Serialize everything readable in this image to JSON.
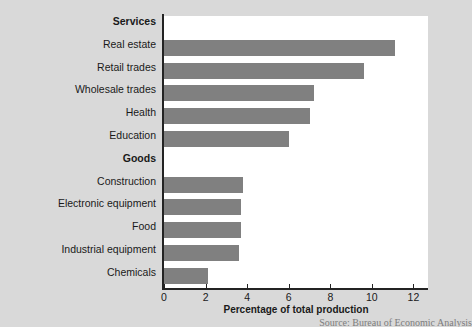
{
  "chart_data": {
    "type": "bar",
    "orientation": "horizontal",
    "title": "",
    "xlabel": "Percentage of total production",
    "ylabel": "",
    "xlim": [
      0,
      12.7
    ],
    "grid": false,
    "legend": null,
    "xticks": [
      0,
      2,
      4,
      6,
      8,
      10,
      12
    ],
    "xticklabels": [
      "0",
      "2",
      "4",
      "6",
      "8",
      "10",
      "12"
    ],
    "bar_color": "#808080",
    "background_color": "#d9d9d9",
    "plot_background_color": "#ffffff",
    "axis_color": "#232323",
    "groups": [
      {
        "name": "Services",
        "categories": [
          "Real estate",
          "Retail trades",
          "Wholesale trades",
          "Health",
          "Education"
        ],
        "values": [
          11.1,
          9.6,
          7.2,
          7.0,
          6.0
        ]
      },
      {
        "name": "Goods",
        "categories": [
          "Construction",
          "Electronic equipment",
          "Food",
          "Industrial equipment",
          "Chemicals"
        ],
        "values": [
          3.8,
          3.7,
          3.7,
          3.6,
          2.1
        ]
      }
    ],
    "categories": [
      "Real estate",
      "Retail trades",
      "Wholesale trades",
      "Health",
      "Education",
      "Construction",
      "Electronic equipment",
      "Food",
      "Industrial equipment",
      "Chemicals"
    ],
    "values": [
      11.1,
      9.6,
      7.2,
      7.0,
      6.0,
      3.8,
      3.7,
      3.7,
      3.6,
      2.1
    ],
    "rows": [
      {
        "label": "Services",
        "kind": "group",
        "value": null
      },
      {
        "label": "Real estate",
        "kind": "bar",
        "value": 11.1
      },
      {
        "label": "Retail trades",
        "kind": "bar",
        "value": 9.6
      },
      {
        "label": "Wholesale trades",
        "kind": "bar",
        "value": 7.2
      },
      {
        "label": "Health",
        "kind": "bar",
        "value": 7.0
      },
      {
        "label": "Education",
        "kind": "bar",
        "value": 6.0
      },
      {
        "label": "Goods",
        "kind": "group",
        "value": null
      },
      {
        "label": "Construction",
        "kind": "bar",
        "value": 3.8
      },
      {
        "label": "Electronic equipment",
        "kind": "bar",
        "value": 3.7
      },
      {
        "label": "Food",
        "kind": "bar",
        "value": 3.7
      },
      {
        "label": "Industrial equipment",
        "kind": "bar",
        "value": 3.6
      },
      {
        "label": "Chemicals",
        "kind": "bar",
        "value": 2.1
      }
    ]
  },
  "footer": {
    "source": "Source: Bureau of Economic Analysis"
  }
}
